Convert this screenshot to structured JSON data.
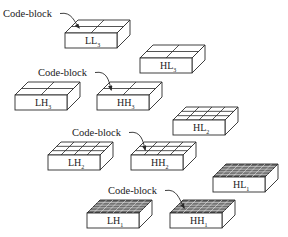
{
  "diagram": {
    "code_block_label": "Code-block",
    "subbands": [
      {
        "id": "LL3",
        "name": "LL",
        "level": "3",
        "x": 65,
        "y": 33,
        "grid": [
          2,
          2
        ],
        "fine": false
      },
      {
        "id": "HL3",
        "name": "HL",
        "level": "3",
        "x": 140,
        "y": 58,
        "grid": [
          2,
          2
        ],
        "fine": false
      },
      {
        "id": "LH3",
        "name": "LH",
        "level": "3",
        "x": 15,
        "y": 95,
        "grid": [
          2,
          2
        ],
        "fine": false
      },
      {
        "id": "HH3",
        "name": "HH",
        "level": "3",
        "x": 97,
        "y": 95,
        "grid": [
          2,
          2
        ],
        "fine": false
      },
      {
        "id": "HL2",
        "name": "HL",
        "level": "2",
        "x": 173,
        "y": 120,
        "grid": [
          4,
          3
        ],
        "fine": false
      },
      {
        "id": "LH2",
        "name": "LH",
        "level": "2",
        "x": 48,
        "y": 155,
        "grid": [
          4,
          3
        ],
        "fine": false
      },
      {
        "id": "HH2",
        "name": "HH",
        "level": "2",
        "x": 131,
        "y": 155,
        "grid": [
          4,
          3
        ],
        "fine": false
      },
      {
        "id": "HL1",
        "name": "HL",
        "level": "1",
        "x": 213,
        "y": 177,
        "grid": [
          8,
          5
        ],
        "fine": true
      },
      {
        "id": "LH1",
        "name": "LH",
        "level": "1",
        "x": 87,
        "y": 213,
        "grid": [
          8,
          5
        ],
        "fine": true
      },
      {
        "id": "HH1",
        "name": "HH",
        "level": "1",
        "x": 170,
        "y": 213,
        "grid": [
          8,
          5
        ],
        "fine": true
      }
    ],
    "callouts": [
      {
        "label": "Code-block",
        "text_x": 3,
        "text_y": 17,
        "target": "LL3"
      },
      {
        "label": "Code-block",
        "text_x": 38,
        "text_y": 76,
        "target": "HH3"
      },
      {
        "label": "Code-block",
        "text_x": 72,
        "text_y": 136,
        "target": "HH2"
      },
      {
        "label": "Code-block",
        "text_x": 108,
        "text_y": 194,
        "target": "HH1"
      }
    ],
    "colors": {
      "line": "#2a2a2a",
      "face": "#ffffff",
      "fine_fill": "#6e6e6e",
      "background": "#ffffff"
    }
  }
}
